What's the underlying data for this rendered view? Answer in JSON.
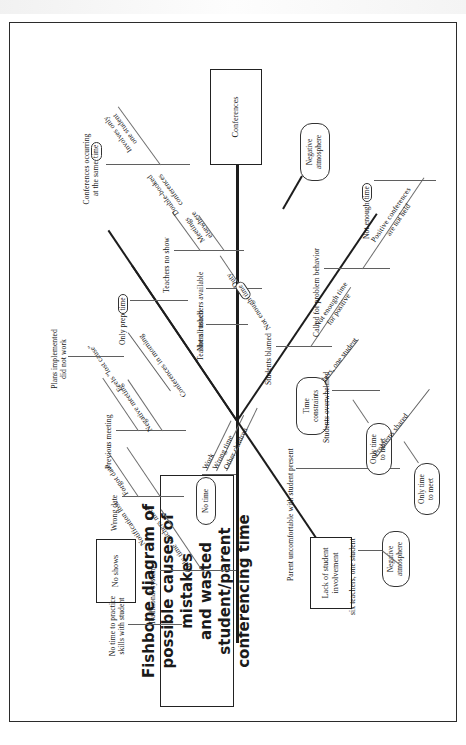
{
  "document": {
    "title_line1": "Fishbone diagram of possible causes of mistakes",
    "title_line2": "and wasted student/parent conferencing time",
    "head_box": "Conferences"
  },
  "colors": {
    "ink": "#1a1a1a",
    "spine": "#1d1d1d",
    "minor_bone": "#6e6e6e",
    "paper": "#ffffff",
    "frame": "#2b2b2b"
  },
  "categories": [
    {
      "id": "no-shows",
      "label": "No shows",
      "shape": "box",
      "side": "upper-left",
      "causes": [
        {
          "label": "Previous meeting",
          "sub": [
            "Negative meeting",
            "Feels \"lost cause\"",
            "Plans implemented did not work"
          ]
        },
        {
          "label": "Wrong date",
          "sub": [
            "Notification lost",
            "Forgot date"
          ]
        }
      ]
    },
    {
      "id": "no-time",
      "label": "No time",
      "shape": "oval",
      "side": "left",
      "causes": [
        {
          "label": "Work",
          "sub": []
        },
        {
          "label": "Wrong time",
          "sub": []
        },
        {
          "label": "Other children",
          "sub": []
        }
      ]
    },
    {
      "id": "traditional-system",
      "label": "Traditional system",
      "shape": "plain",
      "side": "upper-left",
      "causes": [
        {
          "label": "No time to practice skills with student",
          "sub": []
        },
        {
          "label": "Only time teachers meet",
          "sub": []
        }
      ]
    },
    {
      "id": "lack-of-student-involvement",
      "label": "Lack of student involvement",
      "shape": "box",
      "side": "lower-left",
      "causes": [
        {
          "label": "Parent uncomfortable with student present",
          "sub": [
            "Negative atmosphere",
            "six teachers, one student",
            "Only time to meet",
            "Problems shared",
            "Only time to meet"
          ]
        }
      ]
    },
    {
      "id": "time-constraints",
      "label": "Time constraints",
      "shape": "oval",
      "side": "upper-right",
      "causes": [
        {
          "label": "Conferences in morning",
          "sub": [
            "Only prep time",
            "Teachers rushed",
            "Not all teachers available",
            "Duty"
          ]
        },
        {
          "label": "Teachers no show",
          "sub": [
            "Meetings elsewhere",
            "Double-booked conferences"
          ]
        },
        {
          "label": "Conferences occurring at the same time",
          "sub": [
            "Involves only one student"
          ]
        },
        {
          "label": "Not enough time",
          "sub": []
        }
      ]
    },
    {
      "id": "students-blamed",
      "label": "Students blamed",
      "shape": "plain",
      "side": "lower-right",
      "causes": [
        {
          "label": "Not enough time for positive",
          "sub": []
        },
        {
          "label": "Students overwhelmed",
          "sub": []
        },
        {
          "label": "Called for problem behavior",
          "sub": []
        },
        {
          "label": "Positive conferences are not held",
          "sub": [
            "Negative atmosphere",
            "Not enough time"
          ]
        }
      ]
    }
  ],
  "emphasis_pills": [
    "time",
    "time",
    "time",
    "time"
  ],
  "labels": {
    "conferences": "Conferences",
    "no_shows": "No shows",
    "no_time": "No time",
    "work": "Work",
    "wrong_time": "Wrong time",
    "other_children": "Other children",
    "previous_meeting": "Previous meeting",
    "negative_meeting": "Negative meeting",
    "feels_lost_cause": "Feels \"lost cause\"",
    "plans_implemented": "Plans implemented",
    "did_not_work": "did not work",
    "wrong_date": "Wrong date",
    "notification_lost": "Notification lost",
    "forgot_date": "Forgot date",
    "traditional_system": "Traditional system",
    "no_time_practice1": "No time to practice",
    "no_time_practice2": "skills with student",
    "only_time_teachers_meet": "Only time teachers meet",
    "lack_of_student1": "Lack of student",
    "lack_of_student2": "involvement",
    "parent_uncomfortable": "Parent uncomfortable with student present",
    "negative_atmosphere1": "Negative",
    "negative_atmosphere2": "atmosphere",
    "six_teachers_one_student": "six teachers, one student",
    "only_time_to_meet1": "Only time",
    "only_time_to_meet2": "to meet",
    "problems_shared": "Problems shared",
    "time_constraints1": "Time",
    "time_constraints2": "constraints",
    "conferences_in_morning": "Conferences in",
    "conferences_in_morning2": "morning",
    "only_prep": "Only prep",
    "teachers_rushed": "Teachers rushed",
    "not_all_teachers_available": "Not all teachers available",
    "duty": "Duty",
    "teachers_no_show": "Teachers no show",
    "meetings_elsewhere1": "Meetings",
    "meetings_elsewhere2": "elsewhere",
    "double_booked1": "Double-booked",
    "double_booked2": "conferences",
    "conferences_same_time1": "Conferences occurring",
    "conferences_same_time2": "at the same",
    "involves_only1": "Involves only",
    "involves_only2": "one student",
    "not_enough_time": "Not enough",
    "students_blamed": "Students blamed",
    "not_enough_time_for1": "Not enough time",
    "not_enough_time_for2": "for positive",
    "students_overwhelmed": "Students overwhelmed",
    "called_for_problem": "Called for problem behavior",
    "positive_conferences1": "Positive conferences",
    "positive_conferences2": "are not held",
    "time_pill": "time"
  }
}
